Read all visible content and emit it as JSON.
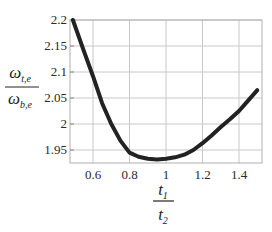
{
  "chart_data": {
    "type": "line",
    "title": "",
    "xlabel": "t1 / t2",
    "ylabel": "ω_t,e / ω_b,e",
    "xlabel_parts": {
      "num": "t",
      "num_sub": "1",
      "den": "t",
      "den_sub": "2"
    },
    "ylabel_parts": {
      "num": "ω",
      "num_sub": "t,e",
      "den": "ω",
      "den_sub": "b,e"
    },
    "xlim": [
      0.48,
      1.61
    ],
    "ylim": [
      1.925,
      2.2
    ],
    "x_ticks": [
      0.6,
      0.8,
      1.0,
      1.2,
      1.4
    ],
    "x_tick_labels": [
      "0.6",
      "0.8",
      "1",
      "1.2",
      "1.4"
    ],
    "y_ticks": [
      1.95,
      2.0,
      2.05,
      2.1,
      2.15,
      2.2
    ],
    "y_tick_labels": [
      "1.95",
      "2",
      "2.05",
      "2.1",
      "2.15",
      "2.2"
    ],
    "grid": true,
    "legend": null,
    "series": [
      {
        "name": "ω_t,e / ω_b,e",
        "color": "#222222",
        "x": [
          0.49,
          0.55,
          0.6,
          0.65,
          0.7,
          0.75,
          0.8,
          0.85,
          0.9,
          0.95,
          1.0,
          1.05,
          1.1,
          1.15,
          1.2,
          1.25,
          1.3,
          1.35,
          1.4,
          1.45,
          1.5
        ],
        "values": [
          2.2,
          2.14,
          2.092,
          2.04,
          2.0,
          1.968,
          1.945,
          1.937,
          1.933,
          1.932,
          1.933,
          1.936,
          1.941,
          1.95,
          1.963,
          1.978,
          1.994,
          2.009,
          2.025,
          2.045,
          2.065
        ]
      }
    ]
  },
  "colors": {
    "grid": "#c8c8c8",
    "frame": "#b0b0b0",
    "curve": "#222222",
    "text": "#2a2a2a"
  }
}
